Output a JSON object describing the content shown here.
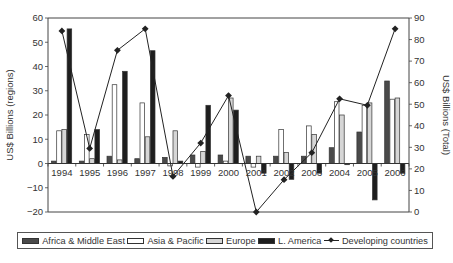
{
  "chart_data": {
    "type": "bar",
    "combo": "bar + line (dual axis)",
    "title": "",
    "categories": [
      "1994",
      "1995",
      "1996",
      "1997",
      "1998",
      "1999",
      "2000",
      "2001",
      "2002",
      "2003",
      "2004",
      "2005",
      "2006"
    ],
    "ylabel": "US$ Billions (regions)",
    "ylabel_right": "US$ Billions (Total)",
    "ylim": [
      -20,
      60
    ],
    "ylim_right": [
      0,
      90
    ],
    "yticks": [
      -20,
      -10,
      0,
      10,
      20,
      30,
      40,
      50,
      60
    ],
    "yticks_right": [
      0,
      10,
      20,
      30,
      40,
      50,
      60,
      70,
      80,
      90
    ],
    "grid": false,
    "legend_position": "bottom",
    "series": [
      {
        "name": "Africa & Middle East",
        "axis": "left",
        "kind": "bar",
        "color": "#4a4a4a",
        "values": [
          1,
          1,
          3,
          2,
          2.5,
          3.5,
          3.5,
          3,
          3,
          3,
          6.5,
          13,
          34
        ]
      },
      {
        "name": "Asia & Pacific",
        "axis": "left",
        "kind": "bar",
        "color": "#ffffff",
        "values": [
          13.5,
          12,
          32.5,
          25,
          -1,
          -1.5,
          1,
          -1.5,
          14,
          15.5,
          25.5,
          24,
          26.5
        ]
      },
      {
        "name": "Europe",
        "axis": "left",
        "kind": "bar",
        "color": "#d6d6d6",
        "values": [
          14,
          2,
          1.5,
          11,
          13.5,
          5,
          27,
          3,
          4.5,
          12,
          20,
          25,
          27
        ]
      },
      {
        "name": "L. America",
        "axis": "left",
        "kind": "bar",
        "color": "#1e1e1e",
        "values": [
          55.5,
          14,
          38,
          46.5,
          1,
          24,
          22,
          -4,
          -6.5,
          -4,
          -0.5,
          -15,
          -4
        ]
      },
      {
        "name": "Developing countries",
        "axis": "right",
        "kind": "line",
        "color": "#222222",
        "values": [
          84,
          29.5,
          75,
          85,
          16.5,
          32,
          54,
          0,
          15,
          27.5,
          52.5,
          49.5,
          85
        ]
      }
    ]
  },
  "legend": {
    "items": [
      {
        "label": "Africa & Middle East",
        "swatch": "#4a4a4a"
      },
      {
        "label": "Asia & Pacific",
        "swatch": "#ffffff"
      },
      {
        "label": "Europe",
        "swatch": "#d6d6d6"
      },
      {
        "label": "L. America",
        "swatch": "#1e1e1e"
      },
      {
        "label": "Developing countries",
        "swatch": "line-diamond"
      }
    ]
  }
}
